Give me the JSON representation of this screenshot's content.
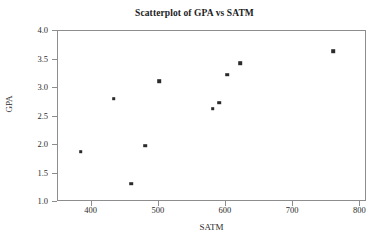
{
  "chart_data": {
    "type": "scatter",
    "title": "Scatterplot of GPA vs SATM",
    "xlabel": "SATM",
    "ylabel": "GPA",
    "xlim": [
      350,
      810
    ],
    "ylim": [
      1.0,
      4.0
    ],
    "xticks": [
      400,
      500,
      600,
      700,
      800
    ],
    "xtick_labels": [
      "400",
      "500",
      "600",
      "700",
      "800"
    ],
    "yticks": [
      1.0,
      1.5,
      2.0,
      2.5,
      3.0,
      3.5,
      4.0
    ],
    "ytick_labels": [
      "1.0",
      "1.5",
      "2.0",
      "2.5",
      "3.0",
      "3.5",
      "4.0"
    ],
    "grid": false,
    "legend": null,
    "marker_color": "#2b2b2b",
    "frame_color": "#8d8d8d",
    "background_color": "#ffffff",
    "points": [
      {
        "x": 384,
        "y": 1.88
      },
      {
        "x": 433,
        "y": 2.81
      },
      {
        "x": 459,
        "y": 1.32
      },
      {
        "x": 480,
        "y": 1.99
      },
      {
        "x": 501,
        "y": 3.12
      },
      {
        "x": 580,
        "y": 2.64
      },
      {
        "x": 590,
        "y": 2.74
      },
      {
        "x": 602,
        "y": 3.23
      },
      {
        "x": 621,
        "y": 3.44
      },
      {
        "x": 760,
        "y": 3.65
      }
    ]
  }
}
